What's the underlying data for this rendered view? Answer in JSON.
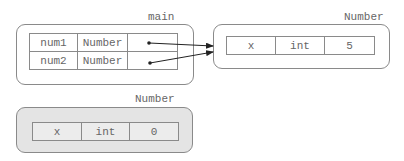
{
  "frames": [
    {
      "id": "main",
      "label": "main",
      "rows": [
        {
          "name": "num1",
          "type": "Number",
          "value": "pointer"
        },
        {
          "name": "num2",
          "type": "Number",
          "value": "pointer"
        }
      ]
    },
    {
      "id": "number-object-1",
      "label": "Number",
      "rows": [
        {
          "name": "x",
          "type": "int",
          "value": "5"
        }
      ]
    },
    {
      "id": "number-object-2",
      "label": "Number",
      "garbage": true,
      "rows": [
        {
          "name": "x",
          "type": "int",
          "value": "0"
        }
      ]
    }
  ],
  "references": [
    {
      "from": "main.num1",
      "to": "number-object-1"
    },
    {
      "from": "main.num2",
      "to": "number-object-1"
    }
  ]
}
